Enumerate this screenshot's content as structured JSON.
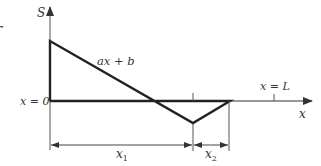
{
  "diagram": {
    "axis_labels": {
      "vertical": "S",
      "horizontal": "x"
    },
    "line_label": "ax + b",
    "origin_label": "x = 0",
    "end_label": "x = L",
    "dimensions": [
      {
        "name": "x",
        "subscript": "1"
      },
      {
        "name": "x",
        "subscript": "2"
      }
    ],
    "edge_glyph": "r",
    "colors": {
      "line": "#222222",
      "axis": "#333333",
      "thin": "#555555",
      "text": "#333333"
    }
  }
}
